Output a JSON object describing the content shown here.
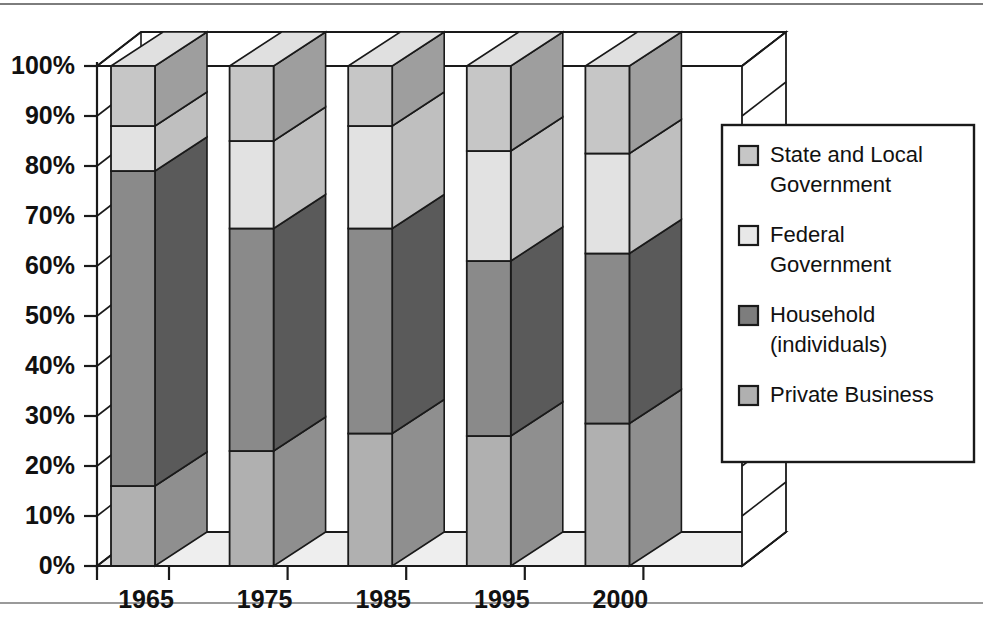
{
  "chart_data": {
    "type": "bar",
    "subtype": "stacked-100-percent-3d",
    "title": "",
    "xlabel": "",
    "ylabel": "",
    "categories": [
      "1965",
      "1975",
      "1985",
      "1995",
      "2000"
    ],
    "ylim": [
      0,
      100
    ],
    "ytick_labels": [
      "0%",
      "10%",
      "20%",
      "30%",
      "40%",
      "50%",
      "60%",
      "70%",
      "80%",
      "90%",
      "100%"
    ],
    "ytick_values": [
      0,
      10,
      20,
      30,
      40,
      50,
      60,
      70,
      80,
      90,
      100
    ],
    "grid": false,
    "legend_position": "right",
    "stack_order_bottom_to_top": [
      "Private Business",
      "Household (individuals)",
      "Federal Government",
      "State and Local Government"
    ],
    "series": [
      {
        "name": "Private Business",
        "color": "#b0b0b0",
        "side_color": "#8f8f8f",
        "top_color": "#d8d8d8",
        "values": [
          16,
          23,
          26.5,
          26,
          28.5
        ]
      },
      {
        "name": "Household (individuals)",
        "color": "#8a8a8a",
        "side_color": "#5a5a5a",
        "top_color": "#a8a8a8",
        "values": [
          63,
          44.5,
          41,
          35,
          34
        ]
      },
      {
        "name": "Federal Government",
        "color": "#e2e2e2",
        "side_color": "#bfbfbf",
        "top_color": "#f2f2f2",
        "values": [
          9,
          17.5,
          20.5,
          22,
          20
        ]
      },
      {
        "name": "State and Local Government",
        "color": "#c6c6c6",
        "side_color": "#9e9e9e",
        "top_color": "#e0e0e0",
        "values": [
          12,
          15,
          12,
          17,
          17.5
        ]
      }
    ],
    "cumulative_tops": {
      "1965": {
        "private_business": 16,
        "household": 79,
        "federal": 88,
        "state_local": 100
      },
      "1975": {
        "private_business": 23,
        "household": 67.5,
        "federal": 85,
        "state_local": 100
      },
      "1985": {
        "private_business": 26.5,
        "household": 67.5,
        "federal": 88,
        "state_local": 100
      },
      "1995": {
        "private_business": 26,
        "household": 61,
        "federal": 83,
        "state_local": 100
      },
      "2000": {
        "private_business": 28.5,
        "household": 62.5,
        "federal": 82.5,
        "state_local": 100
      }
    }
  },
  "legend": {
    "entries": [
      {
        "label_line1": "State and Local",
        "label_line2": "Government",
        "color": "#c6c6c6"
      },
      {
        "label_line1": "Federal",
        "label_line2": "Government",
        "color": "#e8e8e8"
      },
      {
        "label_line1": "Household",
        "label_line2": "(individuals)",
        "color": "#7d7d7d"
      },
      {
        "label_line1": "Private Business",
        "label_line2": "",
        "color": "#b0b0b0"
      }
    ]
  },
  "axis": {
    "y_ticks": [
      {
        "label": "100%",
        "value": 100
      },
      {
        "label": "90%",
        "value": 90
      },
      {
        "label": "80%",
        "value": 80
      },
      {
        "label": "70%",
        "value": 70
      },
      {
        "label": "60%",
        "value": 60
      },
      {
        "label": "50%",
        "value": 50
      },
      {
        "label": "40%",
        "value": 40
      },
      {
        "label": "30%",
        "value": 30
      },
      {
        "label": "20%",
        "value": 20
      },
      {
        "label": "10%",
        "value": 10
      },
      {
        "label": "0%",
        "value": 0
      }
    ],
    "x_ticks": [
      "1965",
      "1975",
      "1985",
      "1995",
      "2000"
    ]
  }
}
